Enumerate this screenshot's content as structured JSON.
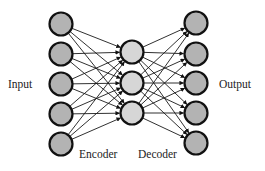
{
  "diagram": {
    "labels": {
      "input": "Input",
      "output": "Output",
      "encoder": "Encoder",
      "decoder": "Decoder"
    },
    "colors": {
      "outer_node_fill": "#b3b3b3",
      "middle_node_fill": "#d6d6d6",
      "node_stroke": "#111111",
      "edge": "#1a1a1a",
      "background": "#ffffff"
    },
    "layers": [
      {
        "name": "input",
        "x": 61,
        "nodes_y": [
          24,
          54,
          84,
          114,
          144
        ]
      },
      {
        "name": "code",
        "x": 132,
        "nodes_y": [
          52,
          83,
          113
        ]
      },
      {
        "name": "output",
        "x": 196,
        "nodes_y": [
          23,
          54,
          83,
          113,
          143
        ]
      }
    ],
    "node_radius": 11.5
  }
}
